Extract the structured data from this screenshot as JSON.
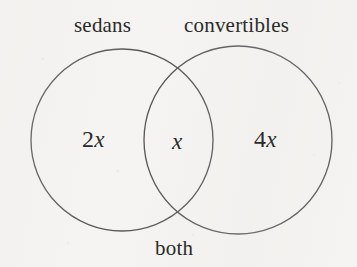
{
  "figure": {
    "type": "venn-diagram",
    "background_color": "#f5f4f2",
    "stroke_color": "#4a4a48",
    "text_color": "#2b2b2b"
  },
  "sets": {
    "left": {
      "name": "sedans",
      "label": "sedans",
      "center_x": 122,
      "center_y": 140,
      "radius": 91
    },
    "right": {
      "name": "convertibles",
      "label": "convertibles",
      "center_x": 238,
      "center_y": 140,
      "radius": 94
    }
  },
  "regions": [
    {
      "name": "sedans-only",
      "coefficient": "2",
      "variable": "x",
      "value": "2x"
    },
    {
      "name": "intersection",
      "coefficient": "",
      "variable": "x",
      "value": "x"
    },
    {
      "name": "convertibles-only",
      "coefficient": "4",
      "variable": "x",
      "value": "4x"
    }
  ],
  "annotations": {
    "intersection_label": "both"
  },
  "chart_data": {
    "type": "venn",
    "title": "",
    "set_labels": [
      "sedans",
      "convertibles"
    ],
    "region_labels": [
      "2x",
      "x",
      "4x"
    ],
    "annotations": [
      "both"
    ],
    "values": {
      "sedans_only": "2x",
      "both": "x",
      "convertibles_only": "4x"
    },
    "legend": "none",
    "grid": false
  }
}
